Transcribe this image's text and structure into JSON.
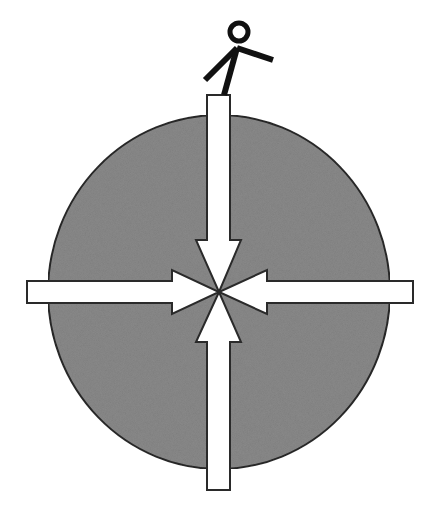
{
  "diagram": {
    "description": "Stick figure standing on a gray sphere with four arrows pointing inward to the center",
    "colors": {
      "background": "#ffffff",
      "sphere_fill": "#8a8a8a",
      "sphere_stroke": "#2a2a2a",
      "arrow_fill": "#ffffff",
      "arrow_stroke": "#2a2a2a",
      "figure": "#111111"
    },
    "sphere": {
      "cx": 219,
      "cy": 292,
      "rx": 171,
      "ry": 177
    },
    "center_point": {
      "x": 219,
      "y": 292
    },
    "arrows": [
      {
        "id": "top",
        "direction": "down",
        "points": "207,95 230,95 230,240 241,240 219,292 196,240 207,240"
      },
      {
        "id": "left",
        "direction": "right",
        "points": "27,281 172,281 172,270 219,292 172,314 172,303 27,303"
      },
      {
        "id": "right",
        "direction": "left",
        "points": "413,281 413,303 267,303 267,314 219,292 267,270 267,281"
      },
      {
        "id": "bottom",
        "direction": "up",
        "points": "207,490 230,490 230,342 241,342 219,292 196,342 207,342"
      }
    ],
    "figure": {
      "head": {
        "cx": 239,
        "cy": 32,
        "r": 9
      },
      "arm_right": "237,48 273,60",
      "body_left_leg": "237,48 205,80",
      "right_leg": "237,48 224,95",
      "hidden_foot": "209,118 205,126"
    }
  }
}
